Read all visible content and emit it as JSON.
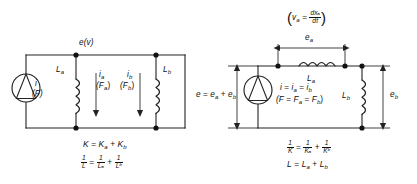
{
  "diagram": {
    "colors": {
      "line": "#222222",
      "node": "#111111",
      "background": "#ffffff",
      "text": "#111111"
    }
  },
  "left_circuit": {
    "name": "parallel-inductors-circuit",
    "source_label": "i",
    "source_label_alt": "(F)",
    "top_node_label": "e(v)",
    "branch_a": {
      "component_label": "L",
      "component_sub": "a",
      "current_label": "i",
      "current_sub": "a",
      "force_label": "(F",
      "force_sub": "a",
      "force_close": ")"
    },
    "branch_b": {
      "component_label": "L",
      "component_sub": "b",
      "current_label": "i",
      "current_sub": "b",
      "force_label": "(F",
      "force_sub": "b",
      "force_close": ")"
    },
    "equations": [
      {
        "id": "k-sum",
        "text": "K = Kₐ + Kᵇ",
        "parts": [
          "K",
          "=",
          "K",
          "a",
          "+",
          "K",
          "b"
        ]
      },
      {
        "id": "inverse-l-sum",
        "numerators": [
          "1",
          "1",
          "1"
        ],
        "denominators": [
          "L",
          "Lₐ",
          "Lᵇ"
        ],
        "operators": [
          "=",
          "+"
        ]
      }
    ]
  },
  "right_circuit": {
    "name": "series-inductors-circuit",
    "top_formula": {
      "open_paren": "(",
      "lhs": "v",
      "lhs_sub": "a",
      "equals": "=",
      "num": "dxₐ",
      "den": "dt",
      "close_paren": ")"
    },
    "dimension_ea": {
      "label": "e",
      "sub": "a"
    },
    "dimension_eb": {
      "label": "e",
      "sub": "b"
    },
    "left_dimension": {
      "text": "e = eₐ + eᵇ",
      "parts": [
        "e",
        "=",
        "e",
        "a",
        "+",
        "e",
        "b"
      ]
    },
    "source_equations": {
      "line1": [
        "i",
        "=",
        "i",
        "a",
        "=",
        "i",
        "b"
      ],
      "line2": [
        "(F",
        "=",
        "F",
        "a",
        "=",
        "F",
        "b",
        ")"
      ]
    },
    "inductor_a": {
      "component_label": "L",
      "component_sub": "a"
    },
    "inductor_b": {
      "component_label": "L",
      "component_sub": "b"
    },
    "equations": [
      {
        "id": "inverse-k-sum",
        "numerators": [
          "1",
          "1",
          "1"
        ],
        "denominators": [
          "K",
          "Kₐ",
          "Kᵇ"
        ],
        "operators": [
          "=",
          "+"
        ]
      },
      {
        "id": "l-sum",
        "text": "L = Lₐ + Lᵇ",
        "parts": [
          "L",
          "=",
          "L",
          "a",
          "+",
          "L",
          "b"
        ]
      }
    ]
  }
}
